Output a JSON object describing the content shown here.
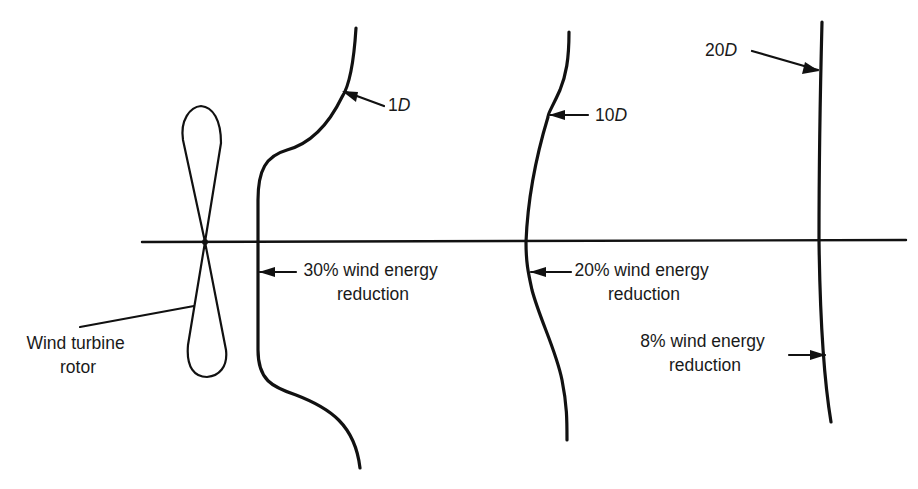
{
  "diagram": {
    "colors": {
      "ink": "#111111",
      "background": "#ffffff"
    },
    "axis": {
      "x1": 142,
      "y1": 242,
      "x2": 906,
      "y2": 240
    },
    "rotor": {
      "label_line1": "Wind turbine",
      "label_line2": "rotor",
      "hub": {
        "x": 205,
        "y": 242
      }
    },
    "distances": [
      {
        "id": "1d",
        "number": "1",
        "unit": "D"
      },
      {
        "id": "10d",
        "number": "10",
        "unit": "D"
      },
      {
        "id": "20d",
        "number": "20",
        "unit": "D"
      }
    ],
    "reductions": [
      {
        "id": "1d",
        "line1": "30% wind energy",
        "line2": "reduction",
        "value_percent": 30
      },
      {
        "id": "10d",
        "line1": "20% wind energy",
        "line2": "reduction",
        "value_percent": 20
      },
      {
        "id": "20d",
        "line1": "8% wind energy",
        "line2": "reduction",
        "value_percent": 8
      }
    ]
  }
}
